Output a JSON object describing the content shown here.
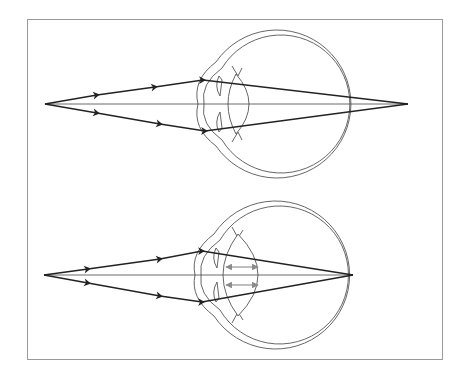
{
  "figure": {
    "type": "optics-diagram",
    "panels": [
      {
        "id": "top",
        "label": "",
        "scenario": "relaxed lens - focal point behind retina",
        "source_point": [
          45,
          104
        ],
        "focal_point": [
          408,
          104
        ],
        "lens_state": "thin",
        "accommodation_arrows": false
      },
      {
        "id": "bottom",
        "label": "",
        "scenario": "accommodated lens - focal point on retina",
        "source_point": [
          44,
          275
        ],
        "focal_point": [
          353,
          275
        ],
        "lens_state": "thick",
        "accommodation_arrows": true
      }
    ],
    "colors": {
      "frame": "#9a9a9a",
      "ray": "#222222",
      "axis": "#444444",
      "eye_outline": "#555555",
      "accommodation_arrow": "#8a8a8a"
    }
  }
}
